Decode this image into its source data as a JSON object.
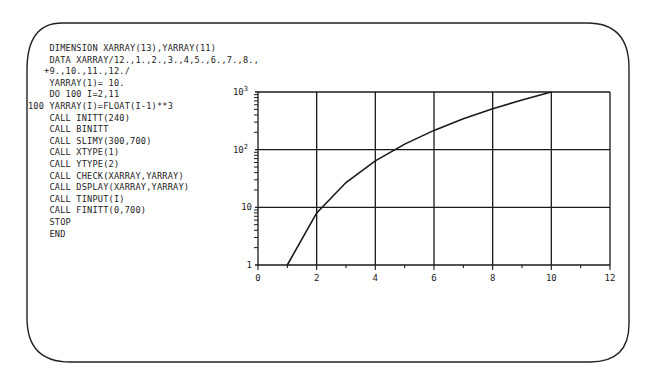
{
  "code": {
    "lines": [
      "    DIMENSION XARRAY(13),YARRAY(11)",
      "    DATA XARRAY/12.,1.,2.,3.,4,5.,6.,7.,8.,",
      "   +9.,10.,11.,12./",
      "    YARRAY(1)= 10.",
      "    DO 100 I=2,11",
      "100 YARRAY(I)=FLOAT(I-1)**3",
      "    CALL INITT(240)",
      "    CALL BINITT",
      "    CALL SLIMY(300,700)",
      "    CALL XTYPE(1)",
      "    CALL YTYPE(2)",
      "    CALL CHECK(XARRAY,YARRAY)",
      "    CALL DSPLAY(XARRAY,YARRAY)",
      "    CALL TINPUT(I)",
      "    CALL FINITT(0,700)",
      "    STOP",
      "    END"
    ]
  },
  "chart_data": {
    "type": "line",
    "title": "",
    "xlabel": "",
    "ylabel": "",
    "x_scale": "linear",
    "y_scale": "log",
    "xlim": [
      0,
      12
    ],
    "ylim": [
      1,
      1000
    ],
    "x_ticks": [
      "0",
      "2",
      "4",
      "6",
      "8",
      "10",
      "12"
    ],
    "y_ticks": [
      "1",
      "10",
      "10²",
      "10³"
    ],
    "grid": true,
    "legend": null,
    "series": [
      {
        "name": "YARRAY = FLOAT(I-1)**3",
        "x": [
          1,
          2,
          3,
          4,
          5,
          6,
          7,
          8,
          9,
          10
        ],
        "y": [
          1,
          8,
          27,
          64,
          125,
          216,
          343,
          512,
          729,
          1000
        ]
      }
    ]
  },
  "colors": {
    "ink": "#1a1a1a",
    "background": "#ffffff"
  }
}
